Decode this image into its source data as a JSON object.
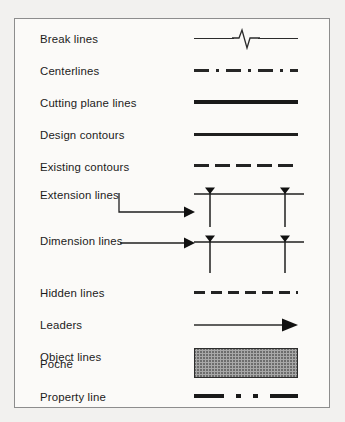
{
  "panel": {
    "name": "drafting-line-types-legend",
    "background": "#fbfaf8",
    "page_background": "#f2f1ef",
    "border_color": "#8d8d8d"
  },
  "rows": [
    {
      "label": "Break lines",
      "sample": "break-line",
      "icon": "break-line-sample"
    },
    {
      "label": "Centerlines",
      "sample": "centerline",
      "icon": "centerline-sample"
    },
    {
      "label": "Cutting plane lines",
      "sample": "cutting-plane",
      "icon": "cutting-plane-line-sample"
    },
    {
      "label": "Design contours",
      "sample": "design-contour",
      "icon": "design-contour-line-sample"
    },
    {
      "label": "Existing contours",
      "sample": "existing-contour",
      "icon": "existing-contour-line-sample"
    },
    {
      "label": "Extension lines",
      "sample": "extension",
      "icon": "extension-line-sample"
    },
    {
      "label": "Dimension lines",
      "sample": "dimension",
      "icon": "dimension-line-sample"
    },
    {
      "label": "Hidden lines",
      "sample": "hidden-line",
      "icon": "hidden-line-sample"
    },
    {
      "label": "Leaders",
      "sample": "leader",
      "icon": "leader-line-sample"
    },
    {
      "label": "Object lines",
      "sample": "object-line",
      "icon": "object-line-sample"
    },
    {
      "label": "Poché",
      "sample": "poche",
      "icon": "poche-fill-swatch"
    },
    {
      "label": "Property line",
      "sample": "property-line",
      "icon": "property-line-sample"
    }
  ],
  "colors": {
    "ink": "#1b1b1b",
    "heavy_line": "#191919",
    "medium_line": "#232323",
    "thin_line": "#2b2b2b",
    "poche_fill": "#a8a8a8",
    "poche_border": "#2d2d2d"
  }
}
